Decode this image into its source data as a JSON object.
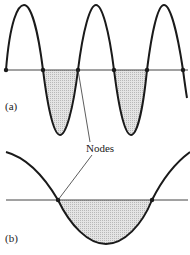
{
  "figure": {
    "panel_a": {
      "label": "(a)",
      "nodes_x": [
        6,
        43,
        78,
        114,
        147,
        183
      ]
    },
    "panel_b": {
      "label": "(b)",
      "nodes_x": [
        58,
        152
      ]
    },
    "annotation": "Nodes",
    "colors": {
      "stroke": "#1a1a1a",
      "fill": "#cfcfcf",
      "axis": "#444444"
    }
  }
}
